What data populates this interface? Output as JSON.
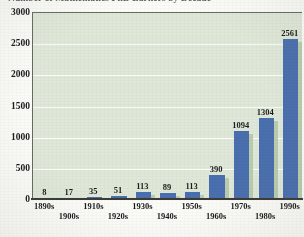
{
  "chart_data": {
    "type": "bar",
    "title": "Number of Mathematics PhD Earners by Decade",
    "xlabel": "",
    "ylabel": "",
    "categories": [
      "1890s",
      "1900s",
      "1910s",
      "1920s",
      "1930s",
      "1940s",
      "1950s",
      "1960s",
      "1970s",
      "1980s",
      "1990s"
    ],
    "values": [
      8,
      17,
      35,
      51,
      113,
      89,
      113,
      390,
      1094,
      1304,
      2561
    ],
    "ylim": [
      0,
      3000
    ],
    "yticks": [
      0,
      500,
      1000,
      1500,
      2000,
      2500,
      3000
    ],
    "ytick_labels": [
      "0",
      "500",
      "1000",
      "1500",
      "2000",
      "2500",
      "3000"
    ],
    "grid": true,
    "legend": false,
    "data_labels": [
      "8",
      "17",
      "35",
      "51",
      "113",
      "89",
      "113",
      "390",
      "1094",
      "1304",
      "2561"
    ],
    "colors": {
      "bar": "#4a6fae",
      "bar_shadow": "#b9ccae",
      "plot_background": "#dfe8d8",
      "gridline": "#fdfdfb",
      "axis": "#3a3a36",
      "text": "#1a1a1a",
      "page_background": "#fbfbf7"
    }
  }
}
